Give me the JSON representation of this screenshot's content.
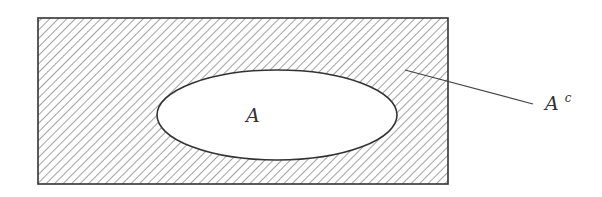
{
  "diagram": {
    "type": "venn-complement",
    "universe": {
      "x": 38,
      "y": 18,
      "width": 410,
      "height": 166,
      "stroke": "#333333",
      "hatch_color": "#7a7a7a",
      "hatch_spacing": 6,
      "hatch_direction": "backslash"
    },
    "set": {
      "label": "A",
      "cx": 277,
      "cy": 115,
      "rx": 120,
      "ry": 45,
      "fill": "#ffffff",
      "stroke": "#333333"
    },
    "complement": {
      "label_base": "A",
      "label_sup": "c",
      "leader": {
        "x1": 405,
        "y1": 70,
        "x2": 533,
        "y2": 104
      }
    }
  },
  "labels": {
    "set_label": "A",
    "complement_base": "A",
    "complement_sup": "c"
  }
}
